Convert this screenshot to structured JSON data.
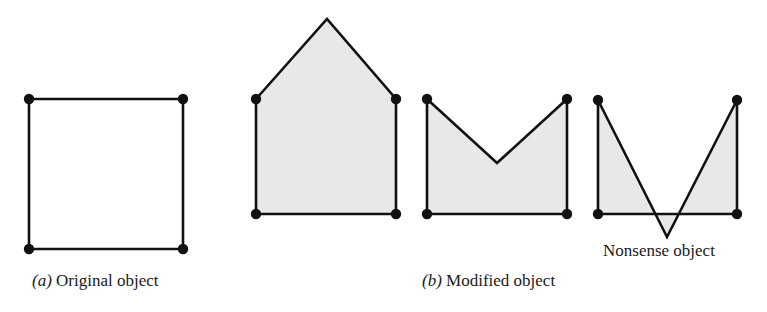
{
  "figure": {
    "background_color": "#ffffff",
    "stroke_color": "#111111",
    "fill_color": "#e8e8e8",
    "vertex_color": "#111111",
    "stroke_width": 2.6,
    "vertex_radius": 5.2
  },
  "captions": {
    "a": {
      "tag": "(a)",
      "tag_letter": "a",
      "text": "Original object",
      "full": "(a) Original object"
    },
    "b": {
      "tag": "(b)",
      "tag_letter": "b",
      "text": "Modified object",
      "full": "(b) Modified object"
    }
  },
  "annotations": {
    "nonsense": {
      "text": "Nonsense object"
    }
  },
  "shapes": [
    {
      "id": "original-square",
      "name": "square-outline",
      "panel": "a",
      "filled": false,
      "closed": true,
      "points": "29,99 183,99 183,249 29,249",
      "vertices": [
        {
          "x": 29,
          "y": 99
        },
        {
          "x": 183,
          "y": 99
        },
        {
          "x": 183,
          "y": 249
        },
        {
          "x": 29,
          "y": 249
        }
      ]
    },
    {
      "id": "house-shape",
      "name": "house-pentagon",
      "panel": "b",
      "filled": true,
      "closed": true,
      "points": "256,99 327,19 396,99 396,214 256,214",
      "vertices": [
        {
          "x": 256,
          "y": 99
        },
        {
          "x": 396,
          "y": 99
        },
        {
          "x": 396,
          "y": 214
        },
        {
          "x": 256,
          "y": 214
        }
      ]
    },
    {
      "id": "notched-shape",
      "name": "v-notch-polygon",
      "panel": "b",
      "filled": true,
      "closed": true,
      "points": "427,99 497,163 567,99 567,214 427,214",
      "vertices": [
        {
          "x": 427,
          "y": 99
        },
        {
          "x": 567,
          "y": 99
        },
        {
          "x": 567,
          "y": 214
        },
        {
          "x": 427,
          "y": 214
        }
      ]
    },
    {
      "id": "nonsense-shape",
      "name": "self-intersecting-polygon",
      "panel": "b",
      "filled": true,
      "closed": true,
      "points": "598,100 667,237 737,100 737,214 598,214",
      "vertices": [
        {
          "x": 598,
          "y": 100
        },
        {
          "x": 737,
          "y": 100
        },
        {
          "x": 737,
          "y": 214
        },
        {
          "x": 598,
          "y": 214
        }
      ]
    }
  ]
}
